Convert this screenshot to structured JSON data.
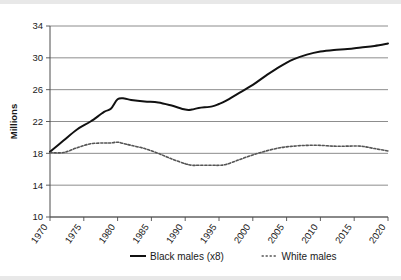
{
  "chart_data": {
    "type": "line",
    "title": "",
    "subtitle": "",
    "xlabel": "",
    "ylabel": "Millions",
    "xlim": [
      1970,
      2020
    ],
    "ylim": [
      10,
      34
    ],
    "yticks": [
      10,
      14,
      18,
      22,
      26,
      30,
      34
    ],
    "ytick_labels": [
      "10",
      "14",
      "18",
      "22",
      "26",
      "30",
      "34"
    ],
    "xticks": [
      1970,
      1975,
      1980,
      1985,
      1990,
      1995,
      2000,
      2005,
      2010,
      2015,
      2020
    ],
    "xtick_labels": [
      "1970",
      "1975",
      "1980",
      "1985",
      "1990",
      "1995",
      "2000",
      "2005",
      "2010",
      "2015",
      "2020"
    ],
    "grid": "horizontal",
    "legend_position": "bottom",
    "x": [
      1970,
      1972,
      1974,
      1976,
      1978,
      1979,
      1980,
      1981,
      1982,
      1984,
      1986,
      1988,
      1990,
      1991,
      1992,
      1994,
      1995,
      1996,
      1998,
      2000,
      2002,
      2004,
      2006,
      2008,
      2010,
      2012,
      2014,
      2016,
      2018,
      2020
    ],
    "series": [
      {
        "name": "Black males (x8)",
        "style": "solid",
        "color": "#111111",
        "values": [
          18.2,
          19.6,
          21.0,
          22.0,
          23.2,
          23.6,
          24.8,
          24.9,
          24.7,
          24.5,
          24.4,
          24.0,
          23.5,
          23.5,
          23.7,
          23.9,
          24.2,
          24.6,
          25.6,
          26.6,
          27.8,
          28.9,
          29.8,
          30.4,
          30.8,
          31.0,
          31.1,
          31.3,
          31.5,
          31.8
        ]
      },
      {
        "name": "White males",
        "style": "dotted",
        "color": "#555555",
        "values": [
          18.1,
          18.1,
          18.7,
          19.2,
          19.3,
          19.3,
          19.4,
          19.2,
          19.0,
          18.6,
          18.0,
          17.3,
          16.7,
          16.5,
          16.5,
          16.5,
          16.5,
          16.6,
          17.2,
          17.8,
          18.3,
          18.7,
          18.9,
          19.0,
          19.0,
          18.9,
          18.9,
          18.9,
          18.6,
          18.3
        ]
      }
    ],
    "legend": [
      {
        "label": "Black males (x8)",
        "style": "solid",
        "color": "#111111"
      },
      {
        "label": "White males",
        "style": "dotted",
        "color": "#555555"
      }
    ]
  }
}
